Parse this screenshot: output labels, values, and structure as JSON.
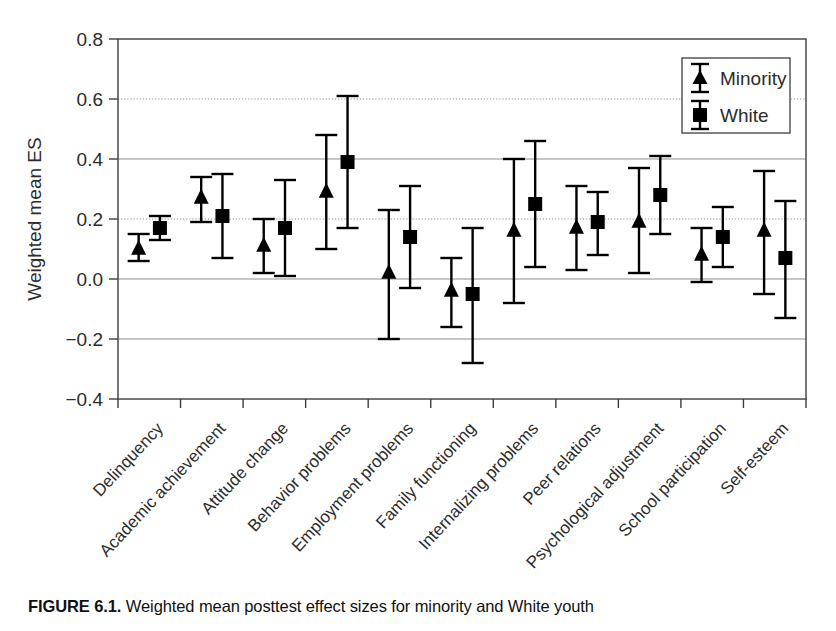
{
  "figure": {
    "caption_label": "FIGURE 6.1.",
    "caption_text": "Weighted mean posttest effect sizes for minority and White youth"
  },
  "chart_data": {
    "type": "scatter",
    "title": "",
    "xlabel": "",
    "ylabel": "Weighted mean ES",
    "ylim": [
      -0.4,
      0.8
    ],
    "yticks": [
      -0.4,
      -0.2,
      0.0,
      0.2,
      0.4,
      0.6,
      0.8
    ],
    "ytick_labels": [
      "−0.4",
      "−0.2",
      "0.0",
      "0.2",
      "0.4",
      "0.6",
      "0.8"
    ],
    "grid": true,
    "legend_position": "top-right",
    "error_bars": "95% confidence interval",
    "categories": [
      "Delinquency",
      "Academic achievement",
      "Attitude change",
      "Behavior problems",
      "Employment problems",
      "Family functioning",
      "Internalizing problems",
      "Peer relations",
      "Psychological adjustment",
      "School participation",
      "Self-esteem"
    ],
    "series": [
      {
        "name": "Minority",
        "marker": "triangle",
        "color": "#000000",
        "values": [
          0.1,
          0.27,
          0.11,
          0.29,
          0.02,
          -0.04,
          0.16,
          0.17,
          0.19,
          0.08,
          0.16
        ],
        "ci_low": [
          0.06,
          0.19,
          0.02,
          0.1,
          -0.2,
          -0.16,
          -0.08,
          0.03,
          0.02,
          -0.01,
          -0.05
        ],
        "ci_high": [
          0.15,
          0.34,
          0.2,
          0.48,
          0.23,
          0.07,
          0.4,
          0.31,
          0.37,
          0.17,
          0.36
        ]
      },
      {
        "name": "White",
        "marker": "square",
        "color": "#000000",
        "values": [
          0.17,
          0.21,
          0.17,
          0.39,
          0.14,
          -0.05,
          0.25,
          0.19,
          0.28,
          0.14,
          0.07
        ],
        "ci_low": [
          0.13,
          0.07,
          0.01,
          0.17,
          -0.03,
          -0.28,
          0.04,
          0.08,
          0.15,
          0.04,
          -0.13
        ],
        "ci_high": [
          0.21,
          0.35,
          0.33,
          0.61,
          0.31,
          0.17,
          0.46,
          0.29,
          0.41,
          0.24,
          0.26
        ]
      }
    ]
  }
}
